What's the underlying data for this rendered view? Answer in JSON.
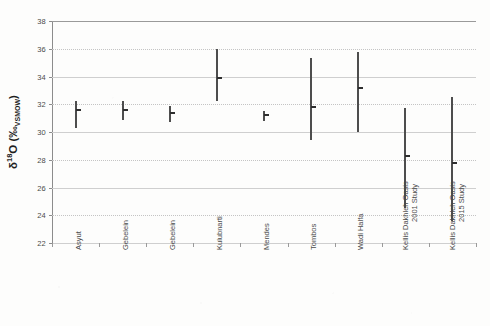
{
  "figure": {
    "background_color": "#fdfdfc",
    "line_color": "#4d4d4d",
    "grid_color": "#cfcfcf"
  },
  "axis": {
    "y_title_delta": "δ",
    "y_title_iso": "18",
    "y_title_elem": "O (‰",
    "y_title_std": "VSMOW",
    "y_title_close": ")",
    "y_title_plain": "δ18O (‰VSMOW)"
  },
  "chart_data": {
    "type": "scatter",
    "title": "",
    "xlabel": "",
    "ylabel": "δ18O (‰VSMOW)",
    "ylim": [
      22,
      38
    ],
    "yticks": [
      22,
      24,
      26,
      28,
      30,
      32,
      34,
      36,
      38
    ],
    "ytick_labels": [
      "22",
      "24",
      "26",
      "28",
      "30",
      "32",
      "34",
      "36",
      "38"
    ],
    "grid": true,
    "legend": "none",
    "categories": [
      "Asyut",
      "Gebelein",
      "Gebelein",
      "Kulubnarti",
      "Mendes",
      "Tombos",
      "Wadi Halfa",
      "Kellis Dakhleh Oasis 2001 Study",
      "Kellis Dakhleh Oasis 2015 Study"
    ],
    "category_lines": [
      [
        "Asyut"
      ],
      [
        "Gebelein"
      ],
      [
        "Gebelein"
      ],
      [
        "Kulubnarti"
      ],
      [
        "Mendes"
      ],
      [
        "Tombos"
      ],
      [
        "Wadi Halfa"
      ],
      [
        "Kellis Dakhleh Oasis",
        "2001 Study"
      ],
      [
        "Kellis Dakhleh Oasis",
        "2015 Study"
      ]
    ],
    "series": [
      {
        "name": "mean",
        "values": [
          31.6,
          31.6,
          31.4,
          33.9,
          31.2,
          31.8,
          33.2,
          28.3,
          27.8
        ]
      },
      {
        "name": "range_min",
        "values": [
          30.3,
          30.9,
          30.7,
          32.2,
          30.8,
          29.4,
          30.0,
          24.5,
          23.6
        ]
      },
      {
        "name": "range_max",
        "values": [
          32.2,
          32.2,
          31.9,
          36.0,
          31.5,
          35.3,
          35.8,
          31.7,
          32.5
        ]
      }
    ],
    "points": [
      {
        "category": "Asyut",
        "mean": 31.6,
        "min": 30.3,
        "max": 32.2
      },
      {
        "category": "Gebelein",
        "mean": 31.6,
        "min": 30.9,
        "max": 32.2
      },
      {
        "category": "Gebelein",
        "mean": 31.4,
        "min": 30.7,
        "max": 31.9
      },
      {
        "category": "Kulubnarti",
        "mean": 33.9,
        "min": 32.2,
        "max": 36.0
      },
      {
        "category": "Mendes",
        "mean": 31.2,
        "min": 30.8,
        "max": 31.5
      },
      {
        "category": "Tombos",
        "mean": 31.8,
        "min": 29.4,
        "max": 35.3
      },
      {
        "category": "Wadi Halfa",
        "mean": 33.2,
        "min": 30.0,
        "max": 35.8
      },
      {
        "category": "Kellis Dakhleh Oasis 2001 Study",
        "mean": 28.3,
        "min": 24.5,
        "max": 31.7
      },
      {
        "category": "Kellis Dakhleh Oasis 2015 Study",
        "mean": 27.8,
        "min": 23.6,
        "max": 32.5
      }
    ]
  }
}
